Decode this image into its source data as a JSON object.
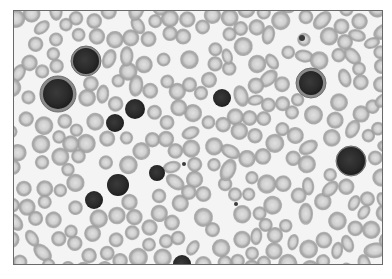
{
  "image": {
    "description": "Grayscale light micrograph of a peripheral blood smear",
    "width": 392,
    "height": 279,
    "frame": {
      "x": 13,
      "y": 10,
      "w": 370,
      "h": 255,
      "border_color": "#6a6a6a"
    },
    "colors": {
      "background": "#f4f4f4",
      "rbc_rim": "#9a9a9a",
      "rbc_fill": "#c4c4c4",
      "rbc_center": "#dcdcdc",
      "wbc_nucleus": "#2e2e2e",
      "wbc_cytoplasm": "#8a8a8a"
    },
    "white_cells": [
      {
        "cx": 57,
        "cy": 93,
        "r": 15,
        "halo": 18
      },
      {
        "cx": 85,
        "cy": 60,
        "r": 13,
        "halo": 15
      },
      {
        "cx": 134,
        "cy": 108,
        "r": 10,
        "halo": 0
      },
      {
        "cx": 114,
        "cy": 122,
        "r": 9,
        "halo": 0
      },
      {
        "cx": 221,
        "cy": 97,
        "r": 9,
        "halo": 0
      },
      {
        "cx": 310,
        "cy": 82,
        "r": 12,
        "halo": 15
      },
      {
        "cx": 117,
        "cy": 184,
        "r": 11,
        "halo": 0
      },
      {
        "cx": 93,
        "cy": 199,
        "r": 9,
        "halo": 0
      },
      {
        "cx": 156,
        "cy": 172,
        "r": 8,
        "halo": 0
      },
      {
        "cx": 181,
        "cy": 263,
        "r": 9,
        "halo": 0
      },
      {
        "cx": 350,
        "cy": 160,
        "r": 14,
        "halo": 15
      }
    ],
    "small_dots": [
      {
        "cx": 301,
        "cy": 37,
        "r": 3
      },
      {
        "cx": 183,
        "cy": 163,
        "r": 2
      },
      {
        "cx": 235,
        "cy": 203,
        "r": 2
      }
    ],
    "rbc_count_estimate": 260,
    "rbc_radius_range": [
      6,
      9
    ]
  }
}
